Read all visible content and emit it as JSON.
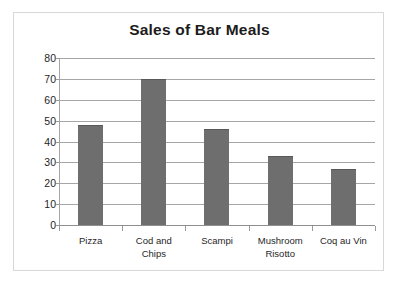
{
  "chart_data": {
    "type": "bar",
    "title": "Sales of Bar Meals",
    "categories": [
      "Pizza",
      "Cod and Chips",
      "Scampi",
      "Mushroom Risotto",
      "Coq au Vin"
    ],
    "category_lines": [
      [
        "Pizza"
      ],
      [
        "Cod and",
        "Chips"
      ],
      [
        "Scampi"
      ],
      [
        "Mushroom",
        "Risotto"
      ],
      [
        "Coq au Vin"
      ]
    ],
    "values": [
      48,
      70,
      46,
      33,
      27
    ],
    "xlabel": "",
    "ylabel": "",
    "ylim": [
      0,
      80
    ],
    "ytick_step": 10,
    "yticks": [
      80,
      70,
      60,
      50,
      40,
      30,
      20,
      10,
      0
    ],
    "ytick_labels": [
      "80",
      "70",
      "60",
      "50",
      "40",
      "30",
      "20",
      "10",
      "0"
    ],
    "grid": true,
    "legend": false,
    "legend_position": "none",
    "series": [
      {
        "name": "Sales",
        "values": [
          48,
          70,
          46,
          33,
          27
        ]
      }
    ],
    "colors": {
      "bar_fill": "#6e6e6e",
      "bar_edge": "#585858",
      "gridline": "#a6a6a6",
      "axis": "#8f8f8f",
      "frame_border": "#d8d8d8",
      "background": "#ffffff",
      "title_text": "#1c1c1c",
      "tick_text": "#1f1f1f"
    }
  }
}
